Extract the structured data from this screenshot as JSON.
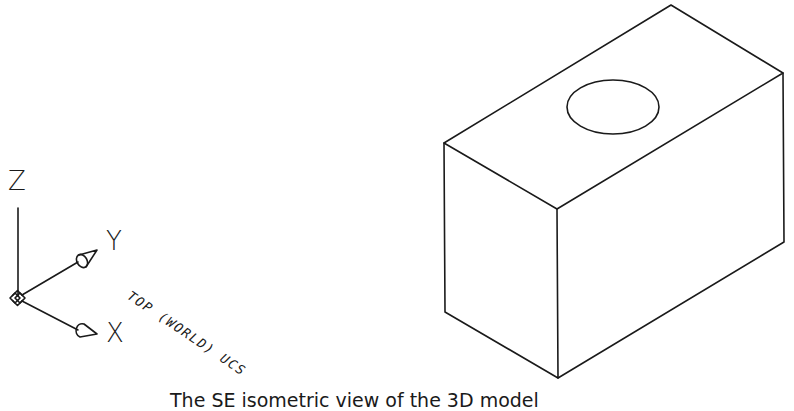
{
  "ucs_icon": {
    "z_label": "Z",
    "y_label": "Y",
    "x_label": "X",
    "caption": "TOP (WORLD) UCS"
  },
  "model": {
    "type": "rectangular block with circular hole on top face",
    "view": "SE isometric"
  },
  "figure": {
    "caption": "The SE isometric view of the 3D model"
  },
  "colors": {
    "line": "#1a1a1a",
    "background": "#ffffff"
  }
}
